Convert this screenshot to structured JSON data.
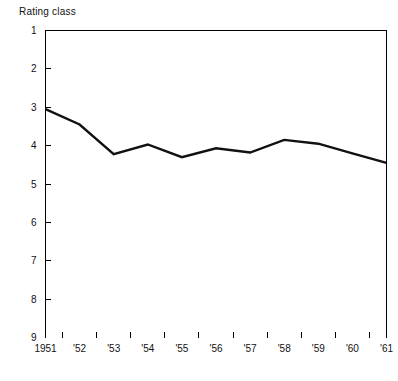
{
  "chart_data": {
    "type": "line",
    "title": "Rating class",
    "xlabel": "",
    "ylabel": "Rating class",
    "x": [
      "1951",
      "1952",
      "1953",
      "1954",
      "1955",
      "1956",
      "1957",
      "1958",
      "1959",
      "1960",
      "1961"
    ],
    "x_tick_labels": [
      "1951",
      "'52",
      "'53",
      "'54",
      "'55",
      "'56",
      "'57",
      "'58",
      "'59",
      "'60",
      "'61"
    ],
    "values": [
      3.05,
      3.45,
      4.22,
      3.97,
      4.3,
      4.07,
      4.18,
      3.85,
      3.95,
      4.2,
      4.45
    ],
    "y_tick_labels": [
      "1",
      "2",
      "3",
      "4",
      "5",
      "6",
      "7",
      "8",
      "9"
    ],
    "y_ticks": [
      1,
      2,
      3,
      4,
      5,
      6,
      7,
      8,
      9
    ],
    "ylim": [
      1,
      9
    ],
    "y_axis_inverted": true,
    "grid": false,
    "legend": false,
    "line_color": "#111111",
    "frame_color": "#000000",
    "background_color": "#ffffff"
  },
  "labels": {
    "y_axis_caption": "Rating class"
  }
}
